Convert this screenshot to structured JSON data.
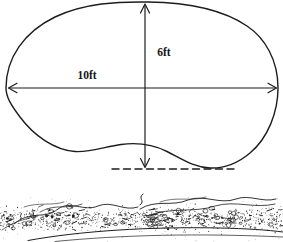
{
  "figure": {
    "type": "pond-dimension-diagram",
    "width_label": "10ft",
    "depth_label": "6ft",
    "colors": {
      "ink": "#1d1d1d",
      "background": "#ffffff"
    }
  }
}
